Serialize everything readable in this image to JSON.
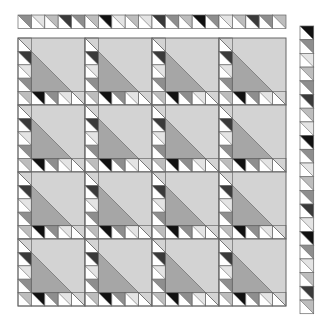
{
  "colors": {
    "background": "#ffffff",
    "outline": "#666666",
    "big_triangle": "#d3d3d3",
    "inner_triangle": "#a6a6a6",
    "white": "#ffffff",
    "black": "#111111",
    "dark": "#3a3a3a",
    "mid": "#8e8e8e",
    "lightgray": "#bdbdbd",
    "light": "#e4e4e4"
  },
  "top_border": {
    "x": 18,
    "y": 15,
    "cell": 13.4,
    "count": 20,
    "fills": [
      "mid",
      "light",
      "lightgray",
      "dark",
      "mid",
      "lightgray",
      "black",
      "light",
      "lightgray",
      "light",
      "dark",
      "mid",
      "lightgray",
      "black",
      "mid",
      "light",
      "lightgray",
      "dark",
      "mid",
      "lightgray"
    ]
  },
  "right_border": {
    "x": 300,
    "y": 26,
    "cell": 13.7,
    "count": 21,
    "fills": [
      "black",
      "mid",
      "light",
      "lightgray",
      "mid",
      "dark",
      "lightgray",
      "light",
      "black",
      "mid",
      "light",
      "lightgray",
      "mid",
      "dark",
      "light",
      "black",
      "mid",
      "light",
      "lightgray",
      "dark",
      "lightgray"
    ]
  },
  "grid": {
    "x": 18,
    "y": 38,
    "block": 67,
    "rows": 4,
    "cols": 4,
    "block_layout": {
      "divisions": 5,
      "left_column_fills": [
        "big",
        "dark",
        "light",
        "mid",
        "lightgray"
      ],
      "bottom_row_fills": [
        "lightgray",
        "black",
        "mid",
        "light",
        "big"
      ]
    }
  }
}
